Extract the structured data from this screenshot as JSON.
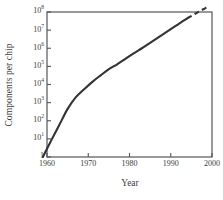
{
  "chart_data": {
    "type": "line",
    "title": "",
    "subtitle": "",
    "xlabel": "Year",
    "ylabel": "Components per chip",
    "xlim": [
      1960,
      2000
    ],
    "ylim": [
      1,
      100000000
    ],
    "yscale": "log",
    "xscale": "linear",
    "grid": false,
    "legend": null,
    "xticks": [
      1960,
      1970,
      1980,
      1990,
      2000
    ],
    "xtick_labels": [
      "1960",
      "1970",
      "1980",
      "1990",
      "2000"
    ],
    "yticks": [
      1,
      10,
      100,
      1000,
      10000,
      100000,
      1000000,
      10000000,
      100000000
    ],
    "ytick_labels": [
      "1",
      "10",
      "10",
      "10",
      "10",
      "10",
      "10",
      "10",
      "10"
    ],
    "ytick_exponents": [
      "",
      "1",
      "2",
      "3",
      "4",
      "5",
      "6",
      "7",
      "8"
    ],
    "series": [
      {
        "name": "Components per chip (historical)",
        "style": "solid",
        "color": "#333333",
        "x": [
          1959,
          1961,
          1963,
          1965,
          1967,
          1969,
          1971,
          1973,
          1975,
          1977,
          1979,
          1981,
          1983,
          1985,
          1987,
          1989,
          1991,
          1993,
          1994
        ],
        "y": [
          1,
          8,
          60,
          450,
          2000,
          5500,
          14000,
          32000,
          70000,
          130000,
          260000,
          520000,
          1000000,
          2000000,
          4000000,
          8000000,
          16000000,
          32000000,
          45000000
        ]
      },
      {
        "name": "Components per chip (projected)",
        "style": "dashed",
        "color": "#333333",
        "x": [
          1994,
          1995.5,
          1997,
          1998.5,
          1999
        ],
        "y": [
          45000000,
          70000000,
          110000000,
          170000000,
          200000000
        ]
      }
    ],
    "annotations": []
  },
  "axes": {
    "frame_color": "#555555",
    "background": "#ffffff"
  }
}
